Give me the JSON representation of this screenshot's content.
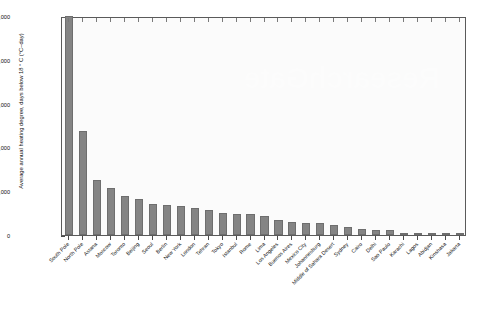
{
  "chart_data": {
    "type": "bar",
    "title": "",
    "xlabel": "",
    "ylabel": "Average annual heating degree, days below 18 ° C (°C–day)",
    "ylim": [
      0,
      25000
    ],
    "ytick_labels": [
      "0",
      "5,000",
      "10,000",
      "15,000",
      "20,000",
      "25,000"
    ],
    "ytick_values": [
      0,
      5000,
      10000,
      15000,
      20000,
      25000
    ],
    "grid": false,
    "legend": "none",
    "bar_color": "#848484",
    "plot_background": "#fbfbfb",
    "note": "South Pole bar is clipped at the 25,000 axis maximum",
    "categories": [
      "South Pole",
      "North Pole",
      "Astana",
      "Moscow",
      "Toronto",
      "Beijing",
      "Seoul",
      "Berlin",
      "New York",
      "London",
      "Tehran",
      "Tokyo",
      "Istanbul",
      "Rome",
      "Lima",
      "Los Angeles",
      "Buenos Aires",
      "Mexico City",
      "Johannesburg",
      "Middle of Sahara Desert",
      "Sydney",
      "Cairo",
      "Delhi",
      "Sao Paulo",
      "Karachi",
      "Lagos",
      "Abidjan",
      "Kinshasa",
      "Jakarta"
    ],
    "values": [
      25000,
      11900,
      6250,
      5400,
      4450,
      4150,
      3550,
      3450,
      3350,
      3100,
      2900,
      2550,
      2450,
      2350,
      2200,
      1750,
      1500,
      1400,
      1350,
      1150,
      900,
      700,
      600,
      520,
      140,
      40,
      25,
      15,
      10
    ]
  },
  "watermark": {
    "text": "ResearchGate"
  }
}
